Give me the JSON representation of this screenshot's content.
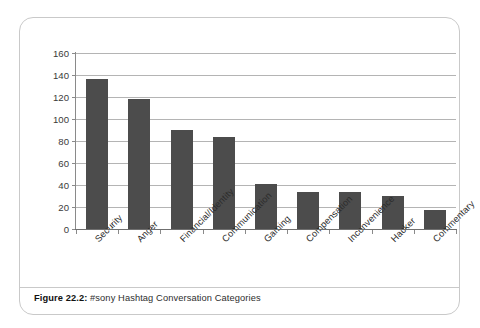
{
  "caption": {
    "label": "Figure 22.2:",
    "text": " #sony Hashtag Conversation Categories"
  },
  "chart_data": {
    "type": "bar",
    "title": "",
    "xlabel": "",
    "ylabel": "",
    "categories": [
      "Security",
      "Anger",
      "Financial/Identity",
      "Communication",
      "Gaming",
      "Compensation",
      "Inconvenience",
      "Hacker",
      "Commentary"
    ],
    "values": [
      136,
      118,
      90,
      84,
      41,
      34,
      34,
      30,
      17
    ],
    "ylim": [
      0,
      160
    ],
    "ytick_labels": [
      "0",
      "20",
      "40",
      "60",
      "80",
      "100",
      "120",
      "140",
      "160"
    ],
    "ytick_values": [
      0,
      20,
      40,
      60,
      80,
      100,
      120,
      140,
      160
    ],
    "grid": true,
    "legend": false,
    "bar_color": "#4c4c4c",
    "gridline_color": "#b4b4b4",
    "axis_color": "#8a8a8a"
  }
}
